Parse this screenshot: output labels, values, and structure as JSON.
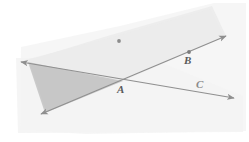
{
  "figure": {
    "type": "geometry-diagram",
    "canvas": {
      "width": 249,
      "height": 142
    },
    "background_color": "#ffffff",
    "paper_tint_color": "#f4f4f4",
    "band_fill_color": "#efefef",
    "triangle_fill_color": "#c9c9c9",
    "line_color": "#8d8d8d",
    "point_dot_color": "#7a7a7a",
    "label_color": "#5a5a5a"
  },
  "labels": {
    "A": "A",
    "B": "B",
    "C": "C"
  },
  "points": [
    {
      "name": "A",
      "label": "A",
      "x": 123,
      "y": 80,
      "dot": false
    },
    {
      "name": "B",
      "label": "B",
      "x": 189,
      "y": 52,
      "dot": true
    },
    {
      "name": "C",
      "label": "C",
      "x": 203,
      "y": 90,
      "dot": false
    },
    {
      "name": "interior-dot",
      "label": "",
      "x": 119,
      "y": 41,
      "dot": true
    }
  ],
  "lines": [
    {
      "name": "line-AB",
      "description": "ray through A and B, double arrowed, rising to the right",
      "x1": 41,
      "y1": 114,
      "x2": 226,
      "y2": 36,
      "arrow_start": true,
      "arrow_end": true
    },
    {
      "name": "line-AC",
      "description": "ray through A and C, double arrowed, descending to the right",
      "x1": 21,
      "y1": 62,
      "x2": 234,
      "y2": 98,
      "arrow_start": true,
      "arrow_end": true
    }
  ],
  "regions": [
    {
      "name": "shaded-triangle",
      "fill": "#c9c9c9",
      "points": "28,62 45,113 123,81"
    },
    {
      "name": "shaded-angle-band",
      "fill": "#efefef",
      "points": "23,62 123,81 226,36 212,6 104,37"
    }
  ],
  "annotations": {
    "caption": ""
  }
}
